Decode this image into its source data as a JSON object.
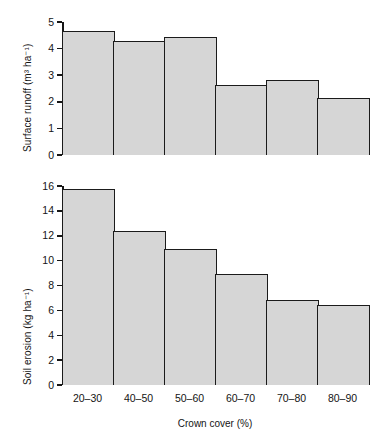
{
  "chart_data": [
    {
      "type": "bar",
      "panel": "top",
      "title": "",
      "xlabel": "Crown cover (%)",
      "ylabel": "Surface runoff (m³ ha⁻¹)",
      "categories": [
        "20–30",
        "40–50",
        "50–60",
        "60–70",
        "70–80",
        "80–90"
      ],
      "values": [
        4.66,
        4.3,
        4.45,
        2.65,
        2.83,
        2.13
      ],
      "ylim": [
        0,
        5
      ],
      "yticks": [
        0,
        1,
        2,
        3,
        4,
        5
      ],
      "ytick_labels": [
        "0",
        "1",
        "2",
        "3",
        "4",
        "5"
      ],
      "grid": false,
      "legend": null,
      "bar_fill": "#d6d6d6",
      "bar_edge": "#1b1b1b"
    },
    {
      "type": "bar",
      "panel": "bottom",
      "title": "",
      "xlabel": "Crown cover (%)",
      "ylabel": "Soil erosion (kg ha⁻¹)",
      "categories": [
        "20–30",
        "40–50",
        "50–60",
        "60–70",
        "70–80",
        "80–90"
      ],
      "values": [
        15.8,
        12.4,
        10.9,
        8.9,
        6.85,
        6.4
      ],
      "ylim": [
        0,
        16
      ],
      "yticks": [
        0,
        2,
        4,
        6,
        8,
        10,
        12,
        14,
        16
      ],
      "ytick_labels": [
        "0",
        "2",
        "4",
        "6",
        "8",
        "10",
        "12",
        "14",
        "16"
      ],
      "grid": false,
      "legend": null,
      "bar_fill": "#d6d6d6",
      "bar_edge": "#1b1b1b"
    }
  ],
  "axes": {
    "shared_x_title": "Crown cover (%)",
    "categories": [
      "20–30",
      "40–50",
      "50–60",
      "60–70",
      "70–80",
      "80–90"
    ]
  }
}
